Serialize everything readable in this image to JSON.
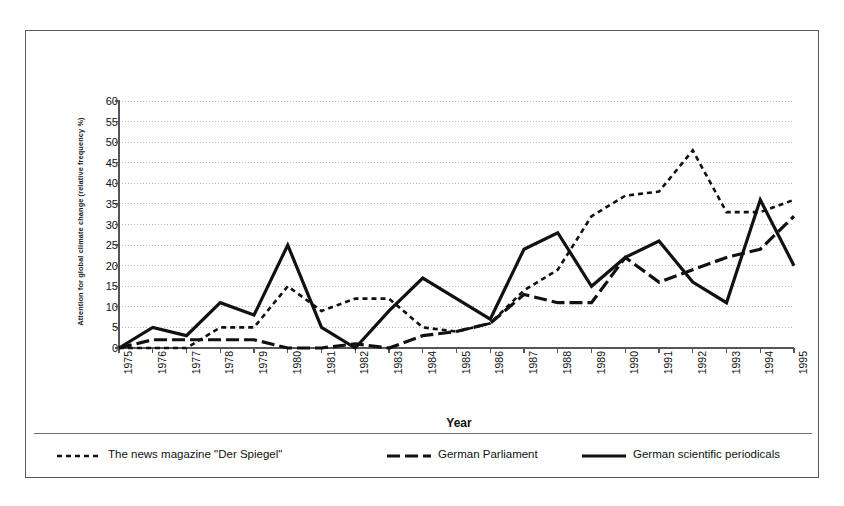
{
  "chart_data": {
    "type": "line",
    "title": "",
    "xlabel": "Year",
    "ylabel": "Attention for global climate change (relative frequency %)",
    "x": [
      1975,
      1976,
      1977,
      1978,
      1979,
      1980,
      1981,
      1982,
      1983,
      1984,
      1985,
      1986,
      1987,
      1988,
      1989,
      1990,
      1991,
      1992,
      1993,
      1994,
      1995
    ],
    "xtick_labels": [
      "1975",
      "1976",
      "1977",
      "1978",
      "1979",
      "1980",
      "1981",
      "1982",
      "1983",
      "1984",
      "1985",
      "1986",
      "1987",
      "1988",
      "1989",
      "1990",
      "1991",
      "1992",
      "1993",
      "1994",
      "1995"
    ],
    "ylim": [
      0,
      60
    ],
    "ytick_labels": [
      "0",
      "5",
      "10",
      "15",
      "20",
      "25",
      "30",
      "35",
      "40",
      "45",
      "50",
      "55",
      "60"
    ],
    "ytick_values": [
      0,
      5,
      10,
      15,
      20,
      25,
      30,
      35,
      40,
      45,
      50,
      55,
      60
    ],
    "xlim": [
      1975,
      1995
    ],
    "grid": "horizontal-dotted",
    "legend_position": "bottom",
    "series": [
      {
        "name": "The news magazine \"Der Spiegel\"",
        "style": "dotted",
        "color": "#111111",
        "linewidth": 2.6,
        "dasharray": "5,4",
        "values": [
          0,
          0,
          0,
          5,
          5,
          15,
          9,
          12,
          12,
          5,
          4,
          6,
          14,
          19,
          32,
          37,
          38,
          48,
          33,
          33,
          36
        ]
      },
      {
        "name": "German Parliament",
        "style": "dashed",
        "color": "#111111",
        "linewidth": 3.2,
        "dasharray": "13,5",
        "values": [
          0,
          2,
          2,
          2,
          2,
          0,
          0,
          1,
          0,
          3,
          4,
          6,
          13,
          11,
          11,
          22,
          16,
          19,
          22,
          24,
          32
        ]
      },
      {
        "name": "German scientific periodicals",
        "style": "solid",
        "color": "#111111",
        "linewidth": 3.2,
        "dasharray": "none",
        "values": [
          0,
          5,
          3,
          11,
          8,
          25,
          5,
          0,
          9,
          17,
          12,
          7,
          24,
          28,
          15,
          22,
          26,
          16,
          11,
          36,
          20
        ]
      }
    ]
  },
  "legend": {
    "items": [
      {
        "label": "The news magazine \"Der Spiegel\"",
        "style": "dotted"
      },
      {
        "label": "German Parliament",
        "style": "dashed"
      },
      {
        "label": "German scientific periodicals",
        "style": "solid"
      }
    ]
  },
  "colors": {
    "line": "#111111",
    "axis": "#555555",
    "grid": "#b9b9b9",
    "frame": "#5a5a5a",
    "background": "#ffffff"
  }
}
